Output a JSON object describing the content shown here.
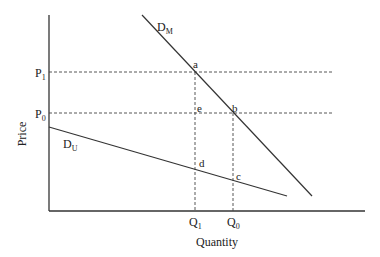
{
  "diagram": {
    "type": "economics-demand-diagram",
    "axes": {
      "y_label": "Price",
      "x_label": "Quantity"
    },
    "price_levels": [
      {
        "id": "P1",
        "base": "P",
        "sub": "1"
      },
      {
        "id": "P0",
        "base": "P",
        "sub": "0"
      }
    ],
    "quantity_levels": [
      {
        "id": "Q1",
        "base": "Q",
        "sub": "1"
      },
      {
        "id": "Q0",
        "base": "Q",
        "sub": "0"
      }
    ],
    "curves": [
      {
        "id": "DM",
        "base": "D",
        "sub": "M",
        "description": "market demand (steeper)"
      },
      {
        "id": "DU",
        "base": "D",
        "sub": "U",
        "description": "flatter demand"
      }
    ],
    "points": [
      {
        "label": "a",
        "at": "DM at P1/Q1"
      },
      {
        "label": "b",
        "at": "DM at P0/Q0"
      },
      {
        "label": "e",
        "at": "P0/Q1"
      },
      {
        "label": "d",
        "at": "DU at Q1"
      },
      {
        "label": "c",
        "at": "DU at Q0"
      }
    ],
    "colors": {
      "line": "#333333",
      "dash": "#444444",
      "text": "#222222"
    }
  }
}
